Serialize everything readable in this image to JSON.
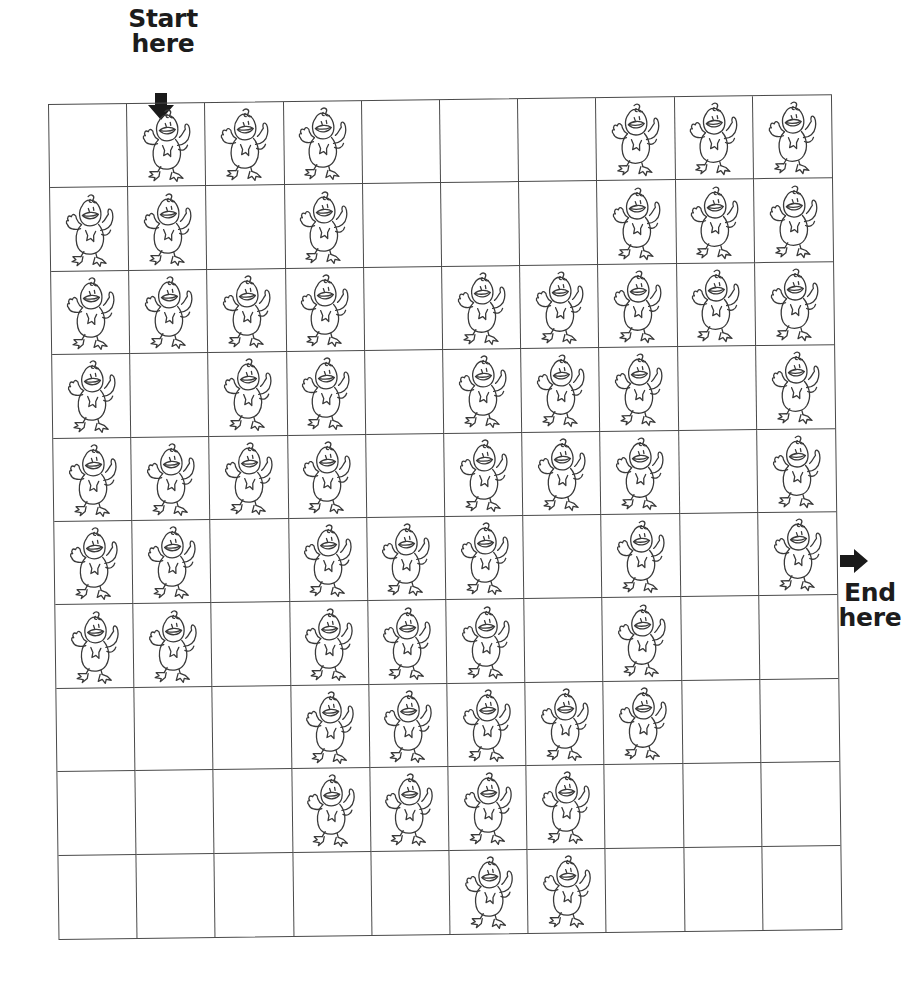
{
  "start": {
    "line1": "Start",
    "line2": "here",
    "arrow": "arrow-down-icon",
    "column": 2
  },
  "end": {
    "line1": "End",
    "line2": "here",
    "arrow": "arrow-right-icon",
    "row": 6
  },
  "grid": {
    "rows": 10,
    "cols": 10,
    "line_color": "#4a4a4a",
    "cell_icon": "duck-icon",
    "legend": "D = cell with duck, . = empty cell",
    "cells": [
      ". D D D . . . D D D",
      "D D . D . . . D D D",
      "D D D D . D D D D D",
      "D . D D . D D D . D",
      "D D D D . D D D . D",
      "D D . D D D . D . D",
      "D D . D D D . D . .",
      ". . . D D D D D . .",
      ". . . D D D D . . .",
      ". . . . . D D . . ."
    ]
  }
}
